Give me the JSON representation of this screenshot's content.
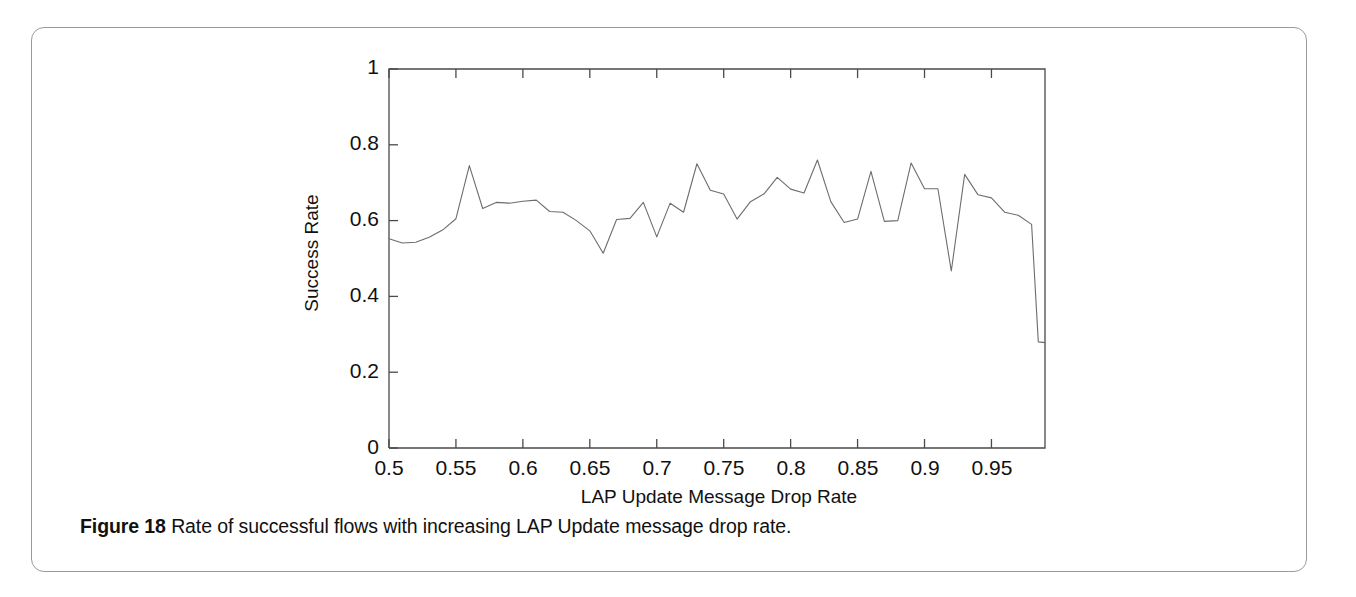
{
  "figure": {
    "caption_number": "Figure 18",
    "caption_text": "Rate of successful flows with increasing LAP Update message drop rate."
  },
  "chart_data": {
    "type": "line",
    "title": "",
    "xlabel": "LAP Update Message Drop Rate",
    "ylabel": "Success Rate",
    "xlim": [
      0.5,
      0.99
    ],
    "ylim": [
      0,
      1
    ],
    "grid": false,
    "legend": null,
    "xticks": [
      "0.5",
      "0.55",
      "0.6",
      "0.65",
      "0.7",
      "0.75",
      "0.8",
      "0.85",
      "0.9",
      "0.95"
    ],
    "xtick_values": [
      0.5,
      0.55,
      0.6,
      0.65,
      0.7,
      0.75,
      0.8,
      0.85,
      0.9,
      0.95
    ],
    "yticks": [
      "0",
      "0.2",
      "0.4",
      "0.6",
      "0.8",
      "1"
    ],
    "ytick_values": [
      0,
      0.2,
      0.4,
      0.6,
      0.8,
      1
    ],
    "line_color": "#6d6d6d",
    "series": [
      {
        "name": "Success Rate",
        "x": [
          0.5,
          0.51,
          0.52,
          0.53,
          0.54,
          0.55,
          0.56,
          0.57,
          0.58,
          0.59,
          0.6,
          0.61,
          0.62,
          0.63,
          0.64,
          0.65,
          0.66,
          0.67,
          0.68,
          0.69,
          0.7,
          0.71,
          0.72,
          0.73,
          0.74,
          0.75,
          0.76,
          0.77,
          0.78,
          0.79,
          0.8,
          0.81,
          0.82,
          0.83,
          0.84,
          0.85,
          0.86,
          0.87,
          0.88,
          0.89,
          0.9,
          0.91,
          0.92,
          0.93,
          0.94,
          0.95,
          0.96,
          0.97,
          0.98
        ],
        "values": [
          0.552,
          0.541,
          0.543,
          0.556,
          0.575,
          0.605,
          0.745,
          0.632,
          0.648,
          0.646,
          0.651,
          0.654,
          0.624,
          0.622,
          0.6,
          0.573,
          0.514,
          0.603,
          0.606,
          0.648,
          0.557,
          0.646,
          0.622,
          0.75,
          0.68,
          0.67,
          0.604,
          0.65,
          0.67,
          0.714,
          0.683,
          0.673,
          0.76,
          0.65,
          0.595,
          0.604,
          0.73,
          0.598,
          0.6,
          0.752,
          0.684,
          0.684,
          0.467,
          0.722,
          0.668,
          0.66,
          0.622,
          0.614,
          0.59
        ]
      }
    ],
    "annotations": [
      {
        "text": "final sharp drop to ~0.28 at right edge",
        "x": 0.985,
        "y": 0.28
      }
    ],
    "tail": {
      "x": [
        0.985,
        0.99
      ],
      "values": [
        0.28,
        0.278
      ]
    }
  }
}
